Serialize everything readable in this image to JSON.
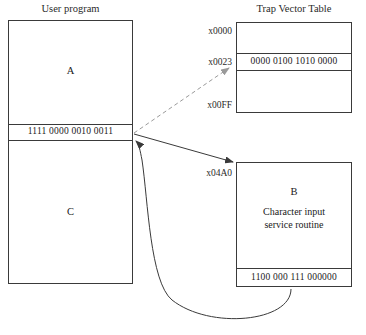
{
  "diagram": {
    "title_user_program": "User program",
    "title_trap_vector_table": "Trap Vector Table",
    "user_program": {
      "section_a_label": "A",
      "trap_instruction": "1111  0000  0010  0011",
      "section_c_label": "C"
    },
    "trap_vector_table": {
      "addr_top": "x0000",
      "addr_entry": "x0023",
      "addr_bottom": "x00FF",
      "entry_value": "0000  0100  1010  0000"
    },
    "service_routine": {
      "addr_start": "x04A0",
      "section_b_label": "B",
      "description_line1": "Character input",
      "description_line2": "service routine",
      "return_instruction": "1100  000  111  000000"
    },
    "colors": {
      "stroke": "#3a3a3a",
      "dashed_stroke": "#9a9a9a",
      "text": "#1a1a1a",
      "background": "#ffffff"
    }
  }
}
